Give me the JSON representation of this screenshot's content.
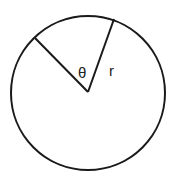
{
  "diagram": {
    "type": "circle-sector",
    "stroke_color": "#1a1a1a",
    "background": "#ffffff",
    "circle": {
      "cx": 88,
      "cy": 93,
      "r": 77
    },
    "radius_lines": [
      {
        "x1": 88,
        "y1": 92,
        "x2": 114,
        "y2": 19
      },
      {
        "x1": 88,
        "y1": 92,
        "x2": 35,
        "y2": 38
      }
    ],
    "labels": {
      "angle": "θ",
      "radius": "r"
    }
  }
}
